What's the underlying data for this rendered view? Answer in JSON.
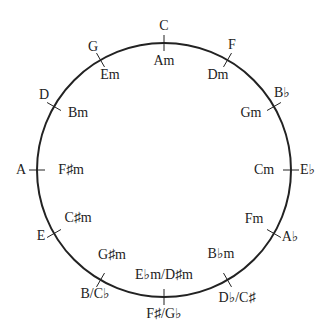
{
  "circle": {
    "cx": 164,
    "cy": 170,
    "r": 127,
    "stroke": "#222222"
  },
  "positions": [
    {
      "major": "C",
      "minor": "Am"
    },
    {
      "major": "F",
      "minor": "Dm"
    },
    {
      "major": "B♭",
      "minor": "Gm"
    },
    {
      "major": "E♭",
      "minor": "Cm"
    },
    {
      "major": "A♭",
      "minor": "Fm"
    },
    {
      "major": "D♭/C♯",
      "minor": "B♭m"
    },
    {
      "major": "F♯/G♭",
      "minor": "E♭m/D♯m"
    },
    {
      "major": "B/C♭",
      "minor": "G♯m"
    },
    {
      "major": "E",
      "minor": "C♯m"
    },
    {
      "major": "A",
      "minor": "F♯m"
    },
    {
      "major": "D",
      "minor": "Bm"
    },
    {
      "major": "G",
      "minor": "Em"
    }
  ]
}
